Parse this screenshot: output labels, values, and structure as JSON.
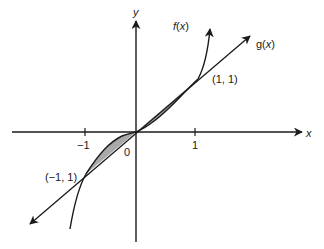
{
  "diagram": {
    "type": "function-graph",
    "axes": {
      "x_label": "x",
      "y_label": "y",
      "origin_label": "0",
      "x_ticks": [
        "−1",
        "1"
      ]
    },
    "curves": [
      {
        "name": "f",
        "label_prefix": "f(",
        "label_var": "x",
        "label_suffix": ")",
        "description": "cubic-like curve through (−1, −1), (0, 0), (1, 1)"
      },
      {
        "name": "g",
        "label_prefix": "g(",
        "label_var": "x",
        "label_suffix": ")",
        "description": "straight line through (−1, −1), (0, 0), (1, 1)"
      }
    ],
    "points": {
      "upper": "(1, 1)",
      "lower": "(−1, 1)"
    },
    "shaded_regions": [
      "between f and g for −1 ≤ x ≤ 0",
      "between f and g for 0 ≤ x ≤ 1"
    ],
    "colors": {
      "stroke": "#1a1a1a",
      "shade": "#a9a9a9",
      "background": "#ffffff"
    }
  }
}
